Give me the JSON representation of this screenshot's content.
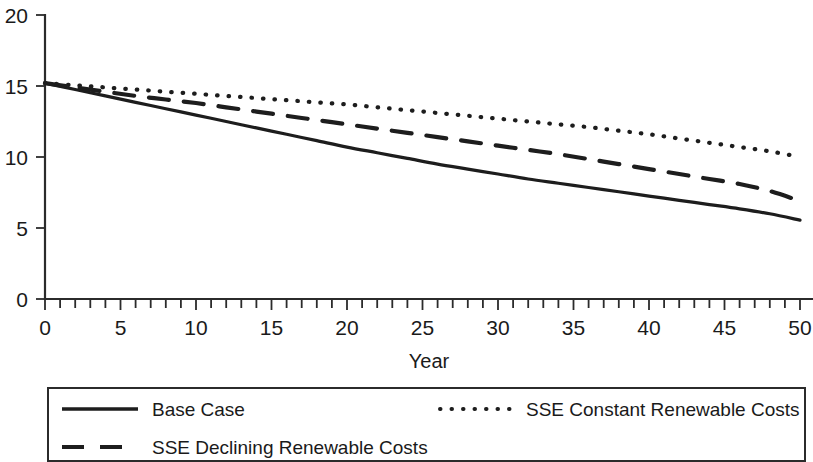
{
  "chart_data": {
    "type": "line",
    "title": "",
    "xlabel": "Year",
    "ylabel": "",
    "xlim": [
      0,
      50
    ],
    "ylim": [
      0,
      20
    ],
    "grid": false,
    "legend_position": "bottom",
    "x_ticks": [
      0,
      5,
      10,
      15,
      20,
      25,
      30,
      35,
      40,
      45,
      50
    ],
    "x_tick_labels": [
      "0",
      "5",
      "10",
      "15",
      "20",
      "25",
      "30",
      "35",
      "40",
      "45",
      "50"
    ],
    "x_minor_tick_step": 1,
    "y_ticks": [
      0,
      5,
      10,
      15,
      20
    ],
    "y_tick_labels": [
      "0",
      "5",
      "10",
      "15",
      "20"
    ],
    "x": [
      0,
      2,
      4,
      6,
      8,
      10,
      12,
      14,
      16,
      18,
      20,
      22,
      24,
      26,
      28,
      30,
      32,
      34,
      36,
      38,
      40,
      42,
      44,
      46,
      48,
      50
    ],
    "series": [
      {
        "name": "Base Case",
        "style": "solid",
        "color": "#1d1d1d",
        "values": [
          15.2,
          14.75,
          14.3,
          13.85,
          13.4,
          12.95,
          12.5,
          12.05,
          11.6,
          11.15,
          10.7,
          10.3,
          9.9,
          9.5,
          9.15,
          8.8,
          8.45,
          8.15,
          7.85,
          7.55,
          7.25,
          6.95,
          6.65,
          6.35,
          6.0,
          5.55
        ]
      },
      {
        "name": "SSE Declining Renewable Costs",
        "style": "dashed",
        "color": "#1d1d1d",
        "values": [
          15.2,
          14.9,
          14.6,
          14.3,
          14.05,
          13.8,
          13.5,
          13.2,
          12.9,
          12.6,
          12.3,
          12.0,
          11.7,
          11.4,
          11.1,
          10.8,
          10.5,
          10.2,
          9.85,
          9.5,
          9.15,
          8.8,
          8.45,
          8.1,
          7.6,
          6.9
        ]
      },
      {
        "name": "SSE Constant Renewable Costs",
        "style": "dotted",
        "color": "#1d1d1d",
        "values": [
          15.2,
          15.05,
          14.9,
          14.75,
          14.6,
          14.45,
          14.3,
          14.15,
          14.0,
          13.85,
          13.7,
          13.5,
          13.3,
          13.1,
          12.9,
          12.7,
          12.5,
          12.3,
          12.1,
          11.85,
          11.6,
          11.3,
          11.0,
          10.7,
          10.4,
          10.0
        ]
      }
    ]
  },
  "legend": {
    "entries": [
      {
        "label": "Base Case",
        "style": "solid"
      },
      {
        "label": "SSE Constant Renewable Costs",
        "style": "dotted"
      },
      {
        "label": "SSE Declining Renewable Costs",
        "style": "dashed"
      }
    ]
  }
}
